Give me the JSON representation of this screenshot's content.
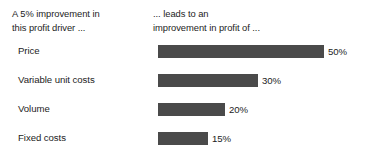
{
  "header": {
    "driver_column": {
      "line1": "A 5% improvement in",
      "line2": "this profit driver ..."
    },
    "profit_column": {
      "line1": "... leads to an",
      "line2": "improvement in profit of ..."
    }
  },
  "chart_data": {
    "type": "bar",
    "title": "",
    "subtitle": "",
    "xlabel": "",
    "ylabel": "",
    "orientation": "horizontal",
    "grid": false,
    "legend": false,
    "bar_color": "#4a4a4a",
    "text_color": "#1c1c1c",
    "background": "#ffffff",
    "xlim": [
      0,
      50
    ],
    "px_per_percent": 3.32,
    "categories": [
      "Price",
      "Variable unit costs",
      "Volume",
      "Fixed costs"
    ],
    "values": [
      50,
      30,
      20,
      15
    ],
    "value_labels": [
      "50%",
      "30%",
      "20%",
      "15%"
    ],
    "rows": [
      {
        "label": "Price",
        "value": 50,
        "value_label": "50%",
        "bar_px": 166
      },
      {
        "label": "Variable unit costs",
        "value": 30,
        "value_label": "30%",
        "bar_px": 100
      },
      {
        "label": "Volume",
        "value": 20,
        "value_label": "20%",
        "bar_px": 67
      },
      {
        "label": "Fixed costs",
        "value": 15,
        "value_label": "15%",
        "bar_px": 50
      }
    ]
  }
}
